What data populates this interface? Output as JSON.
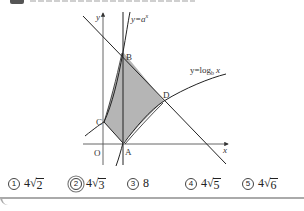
{
  "graph": {
    "axis_labels": {
      "x": "x",
      "y": "y",
      "origin": "O"
    },
    "curves": {
      "exp_label": "y=a^x",
      "exp_label_base": "y=a",
      "exp_label_sup": "x",
      "log_label": "y=log_b x",
      "log_label_main": "y=log",
      "log_label_sub": "b",
      "log_label_var": "x"
    },
    "points": {
      "A": "A",
      "B": "B",
      "C": "C",
      "D": "D"
    },
    "colors": {
      "shade": "#b5b5b5",
      "line": "#222222",
      "axis": "#555555"
    }
  },
  "choices": [
    {
      "num": "1",
      "coef": "4",
      "radicand": "2",
      "text": "4√2",
      "marked": false
    },
    {
      "num": "2",
      "coef": "4",
      "radicand": "3",
      "text": "4√3",
      "marked": true
    },
    {
      "num": "3",
      "coef": "8",
      "radicand": "",
      "text": "8",
      "marked": false
    },
    {
      "num": "4",
      "coef": "4",
      "radicand": "5",
      "text": "4√5",
      "marked": false
    },
    {
      "num": "5",
      "coef": "4",
      "radicand": "6",
      "text": "4√6",
      "marked": false
    }
  ]
}
